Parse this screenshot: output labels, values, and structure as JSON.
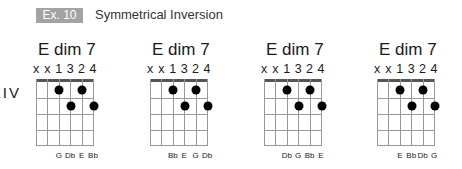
{
  "header": {
    "badge": "Ex. 10",
    "title": "Symmetrical Inversion",
    "badge_color": "#a3a3a3"
  },
  "chords": [
    {
      "name": "E dim 7",
      "position": "V",
      "fingering": [
        "x",
        "x",
        "1",
        "3",
        "2",
        "4"
      ],
      "dots": [
        {
          "string": 3,
          "fret": 1
        },
        {
          "string": 5,
          "fret": 1
        },
        {
          "string": 4,
          "fret": 2
        },
        {
          "string": 6,
          "fret": 2
        }
      ],
      "notes": [
        {
          "string": 3,
          "label": "G"
        },
        {
          "string": 4,
          "label": "Db"
        },
        {
          "string": 5,
          "label": "E"
        },
        {
          "string": 6,
          "label": "Bb"
        }
      ]
    },
    {
      "name": "E dim 7",
      "position": "VIII",
      "fingering": [
        "x",
        "x",
        "1",
        "3",
        "2",
        "4"
      ],
      "dots": [
        {
          "string": 3,
          "fret": 1
        },
        {
          "string": 5,
          "fret": 1
        },
        {
          "string": 4,
          "fret": 2
        },
        {
          "string": 6,
          "fret": 2
        }
      ],
      "notes": [
        {
          "string": 3,
          "label": "Bb"
        },
        {
          "string": 4,
          "label": "E"
        },
        {
          "string": 5,
          "label": "G"
        },
        {
          "string": 6,
          "label": "Db"
        }
      ]
    },
    {
      "name": "E dim 7",
      "position": "XI",
      "fingering": [
        "x",
        "x",
        "1",
        "3",
        "2",
        "4"
      ],
      "dots": [
        {
          "string": 3,
          "fret": 1
        },
        {
          "string": 5,
          "fret": 1
        },
        {
          "string": 4,
          "fret": 2
        },
        {
          "string": 6,
          "fret": 2
        }
      ],
      "notes": [
        {
          "string": 3,
          "label": "Db"
        },
        {
          "string": 4,
          "label": "G"
        },
        {
          "string": 5,
          "label": "Bb"
        },
        {
          "string": 6,
          "label": "E"
        }
      ]
    },
    {
      "name": "E dim 7",
      "position": "XIV",
      "fingering": [
        "x",
        "x",
        "1",
        "3",
        "2",
        "4"
      ],
      "dots": [
        {
          "string": 3,
          "fret": 1
        },
        {
          "string": 5,
          "fret": 1
        },
        {
          "string": 4,
          "fret": 2
        },
        {
          "string": 6,
          "fret": 2
        }
      ],
      "notes": [
        {
          "string": 3,
          "label": "E"
        },
        {
          "string": 4,
          "label": "Bb"
        },
        {
          "string": 5,
          "label": "Db"
        },
        {
          "string": 6,
          "label": "G"
        }
      ]
    }
  ]
}
